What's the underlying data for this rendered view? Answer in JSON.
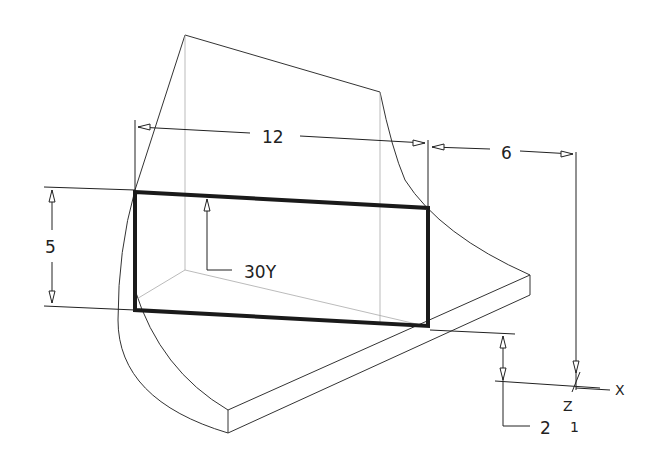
{
  "drawing": {
    "type": "CAD isometric view with dimensions",
    "dimensions": {
      "width": "12",
      "offset_x": "6",
      "height": "5",
      "offset_y": "2",
      "rotation": "30Y"
    },
    "axis_labels": {
      "x": "X",
      "z": "Z",
      "one": "1"
    },
    "colors": {
      "line": "#333333",
      "hidden_line": "#aaaaaa",
      "profile": "#1a1a1a",
      "background": "#ffffff"
    }
  }
}
